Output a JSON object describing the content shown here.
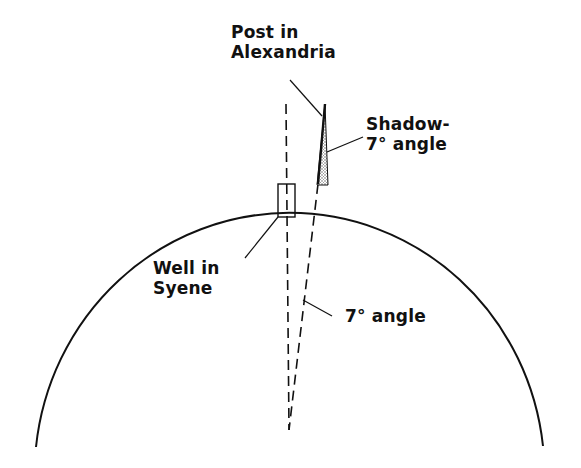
{
  "diagram": {
    "labels": {
      "post": {
        "line1": "Post in",
        "line2": "Alexandria"
      },
      "shadow": {
        "line1": "Shadow-",
        "line2": "7° angle"
      },
      "well": {
        "line1": "Well in",
        "line2": "Syene"
      },
      "center_angle": {
        "text": "7° angle"
      }
    },
    "colors": {
      "ink": "#111111",
      "background": "#ffffff",
      "shadow_fill": "#9a9a9a"
    },
    "geometry": {
      "earth_arc": {
        "start": [
          36,
          447
        ],
        "end": [
          543,
          446
        ],
        "top_y": 184,
        "radius": 255
      },
      "center_apex": [
        289,
        430
      ],
      "well_rect": {
        "x": 278,
        "y": 184,
        "w": 17,
        "h": 33
      },
      "post": {
        "base": [
          318,
          184
        ],
        "top": [
          325,
          104
        ]
      },
      "angle_deg": 7
    }
  }
}
